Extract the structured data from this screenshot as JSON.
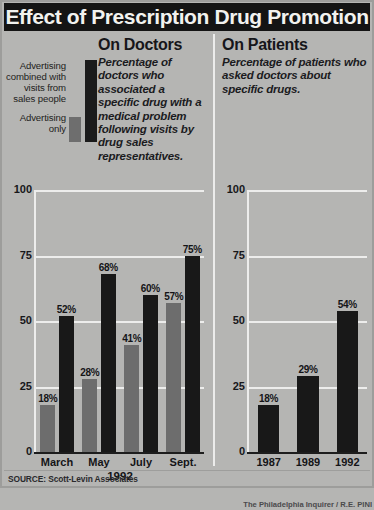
{
  "title": "Effect of Prescription Drug Promotion",
  "panels": {
    "doctors": {
      "heading": "On Doctors",
      "blurb": "Percentage of doctors who associated a specific drug with a medical problem following visits by drug sales representatives.",
      "xaxis_title": "1992"
    },
    "patients": {
      "heading": "On Patients",
      "blurb": "Percentage of patients who asked doctors about specific drugs."
    }
  },
  "legend": {
    "items": [
      {
        "label": "Advertising combined with visits from sales people",
        "color": "#181818"
      },
      {
        "label": "Advertising only",
        "color": "#6d6d6d"
      }
    ]
  },
  "footer": {
    "source": "SOURCE: Scott-Levin Associates",
    "credit": "The Philadelphia Inquirer / R.E. PINI"
  },
  "chart_data": [
    {
      "type": "bar",
      "title": "On Doctors",
      "id": "doctors",
      "xlabel": "1992",
      "ylabel": "",
      "ylim": [
        0,
        100
      ],
      "yticks": [
        0,
        25,
        50,
        75,
        100
      ],
      "grid": true,
      "legend_position": "upper-left-external",
      "categories": [
        "March",
        "May",
        "July",
        "Sept."
      ],
      "series": [
        {
          "name": "Advertising only",
          "color": "#6d6d6d",
          "values": [
            18,
            28,
            41,
            57
          ],
          "labels": [
            "18%",
            "28%",
            "41%",
            "57%"
          ]
        },
        {
          "name": "Advertising combined with visits from sales people",
          "color": "#181818",
          "values": [
            52,
            68,
            60,
            75
          ],
          "labels": [
            "52%",
            "68%",
            "60%",
            "75%"
          ]
        }
      ]
    },
    {
      "type": "bar",
      "title": "On Patients",
      "id": "patients",
      "xlabel": "",
      "ylabel": "",
      "ylim": [
        0,
        100
      ],
      "yticks": [
        0,
        25,
        50,
        75,
        100
      ],
      "grid": true,
      "categories": [
        "1987",
        "1989",
        "1992"
      ],
      "series": [
        {
          "name": "Percentage of patients who asked doctors about specific drugs",
          "color": "#181818",
          "values": [
            18,
            29,
            54
          ],
          "labels": [
            "18%",
            "29%",
            "54%"
          ]
        }
      ]
    }
  ]
}
